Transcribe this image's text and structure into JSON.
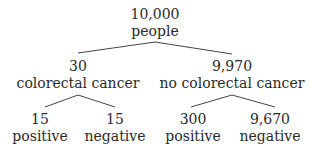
{
  "tree": {
    "root": {
      "count": "10,000",
      "label": "people"
    },
    "branches": [
      {
        "count": "30",
        "label": "colorectal cancer",
        "children": [
          {
            "count": "15",
            "label": "positive"
          },
          {
            "count": "15",
            "label": "negative"
          }
        ]
      },
      {
        "count": "9,970",
        "label": "no colorectal cancer",
        "children": [
          {
            "count": "300",
            "label": "positive"
          },
          {
            "count": "9,670",
            "label": "negative"
          }
        ]
      }
    ]
  }
}
